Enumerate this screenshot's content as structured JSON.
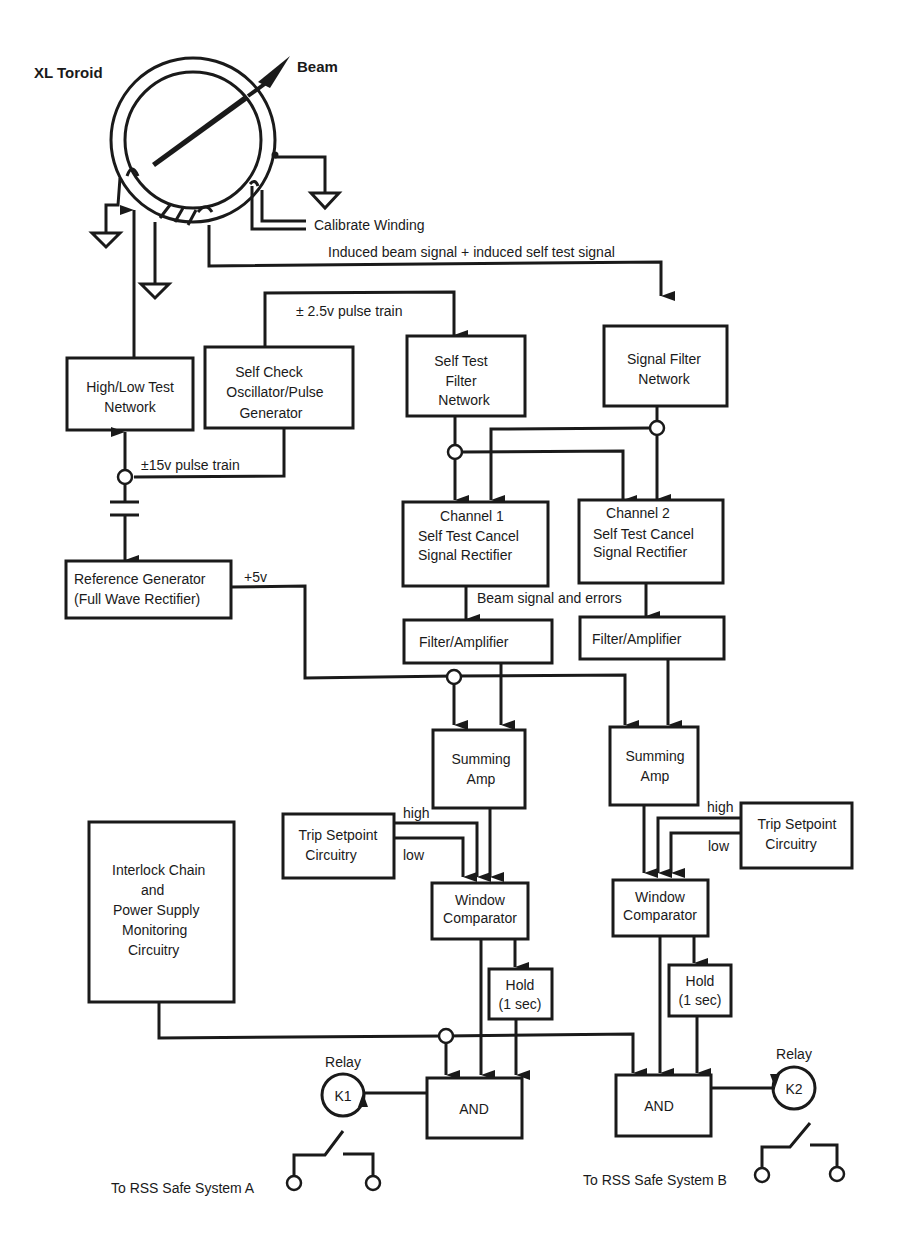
{
  "title_fragment": "",
  "toroid": {
    "label": "XL Toroid",
    "beam_label": "Beam",
    "calibrate_label": "Calibrate Winding",
    "induced_label": "Induced beam signal + induced self test signal"
  },
  "signals": {
    "pulse_2_5": "± 2.5v pulse train",
    "pulse_15": "±15v pulse train",
    "plus_5v": "+5v",
    "beam_errors": "Beam signal and errors"
  },
  "blocks": {
    "high_low": [
      "High/Low Test",
      "Network"
    ],
    "self_check": [
      "Self Check",
      "Oscillator/Pulse",
      "Generator"
    ],
    "self_test_filter": [
      "Self Test",
      "Filter",
      "Network"
    ],
    "signal_filter": [
      "Signal Filter",
      "Network"
    ],
    "reference_gen": [
      "Reference Generator",
      "(Full Wave Rectifier)"
    ],
    "ch1_rectifier": [
      "Channel 1",
      "Self Test Cancel",
      "Signal Rectifier"
    ],
    "ch2_rectifier": [
      "Channel 2",
      "Self Test Cancel",
      "Signal Rectifier"
    ],
    "filter_amp_1": "Filter/Amplifier",
    "filter_amp_2": "Filter/Amplifier",
    "summing_1": [
      "Summing",
      "Amp"
    ],
    "summing_2": [
      "Summing",
      "Amp"
    ],
    "trip_1": [
      "Trip Setpoint",
      "Circuitry"
    ],
    "trip_2": [
      "Trip Setpoint",
      "Circuitry"
    ],
    "window_1": [
      "Window",
      "Comparator"
    ],
    "window_2": [
      "Window",
      "Comparator"
    ],
    "hold_1": [
      "Hold",
      "(1 sec)"
    ],
    "hold_2": [
      "Hold",
      "(1 sec)"
    ],
    "interlock": [
      "Interlock Chain",
      "and",
      "Power Supply",
      "Monitoring",
      "Circuitry"
    ],
    "and_1": "AND",
    "and_2": "AND"
  },
  "trip_labels": {
    "high": "high",
    "low": "low"
  },
  "relays": {
    "k1": {
      "title": "Relay",
      "id": "K1",
      "dest": "To RSS Safe System A"
    },
    "k2": {
      "title": "Relay",
      "id": "K2",
      "dest": "To RSS Safe System B"
    }
  }
}
